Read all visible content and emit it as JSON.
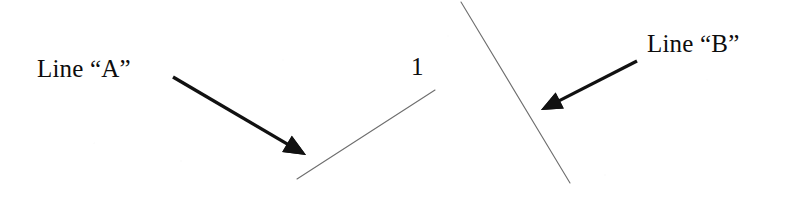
{
  "figure": {
    "width": 786,
    "height": 199,
    "background_color": "#ffffff",
    "ink_color": "#111111",
    "thin_line_color": "#6e6e6e"
  },
  "labels": {
    "line_a": "Line “A”",
    "line_b": "Line “B”",
    "numeral_one": "1"
  },
  "chart_data": {
    "type": "diagram",
    "title": "",
    "elements": [
      {
        "name": "line-a",
        "kind": "line-segment",
        "label": "Line “A”",
        "stroke": "#6e6e6e",
        "stroke_width": 1.1,
        "x1": 297,
        "y1": 179,
        "x2": 435,
        "y2": 90,
        "slope_direction": "rising to the right"
      },
      {
        "name": "line-b",
        "kind": "line-segment",
        "label": "Line “B”",
        "stroke": "#6e6e6e",
        "stroke_width": 1.1,
        "x1": 461,
        "y1": 2,
        "x2": 570,
        "y2": 183,
        "slope_direction": "falling to the right"
      },
      {
        "name": "arrow-a",
        "kind": "arrow",
        "stroke": "#111111",
        "stroke_width": 3.4,
        "tail_x": 173,
        "tail_y": 77,
        "tip_x": 306,
        "tip_y": 155,
        "points_to": "line-a"
      },
      {
        "name": "arrow-b",
        "kind": "arrow",
        "stroke": "#111111",
        "stroke_width": 3.2,
        "tail_x": 637,
        "tail_y": 61,
        "tip_x": 541,
        "tip_y": 110,
        "points_to": "line-b"
      },
      {
        "name": "numeral-one",
        "kind": "text",
        "text": "1",
        "x": 411,
        "y": 54
      }
    ]
  }
}
